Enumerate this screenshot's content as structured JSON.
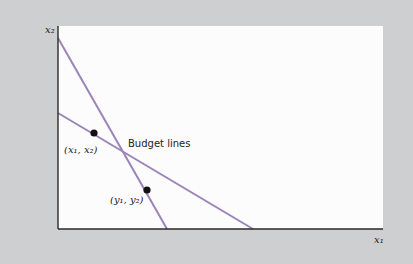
{
  "diagram": {
    "axes": {
      "y_label": "x₂",
      "x_label": "x₁"
    },
    "annotation": "Budget lines",
    "points": [
      {
        "label": "(x₁, x₂)",
        "cx": 94,
        "cy": 133
      },
      {
        "label": "(y₁, y₂)",
        "cx": 147,
        "cy": 190
      }
    ],
    "lines": [
      {
        "name": "steep-budget-line",
        "x1": 58,
        "y1": 38,
        "x2": 167,
        "y2": 229
      },
      {
        "name": "shallow-budget-line",
        "x1": 58,
        "y1": 113,
        "x2": 253,
        "y2": 229
      }
    ],
    "colors": {
      "background": "#cdcfd1",
      "plot_area": "#fcfcfd",
      "line": "#9b84b8",
      "axis": "#2a2a2a",
      "point": "#111111"
    }
  }
}
